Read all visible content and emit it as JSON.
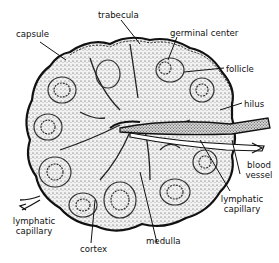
{
  "diagram": {
    "labels": {
      "capsule": "capsule",
      "trabecula": "trabecula",
      "germinal_center": "germinal center",
      "follicle": "follicle",
      "hilus": "hilus",
      "blood_vessel_1": "blood",
      "blood_vessel_2": "vessel",
      "lymphatic_capillary_right_1": "lymphatic",
      "lymphatic_capillary_right_2": "capillary",
      "lymphatic_capillary_left_1": "lymphatic",
      "lymphatic_capillary_left_2": "capillary",
      "cortex": "cortex",
      "medulla": "medulla"
    },
    "colors": {
      "ink": "#111111",
      "fill": "#e9e9e9",
      "background": "#ffffff"
    }
  }
}
